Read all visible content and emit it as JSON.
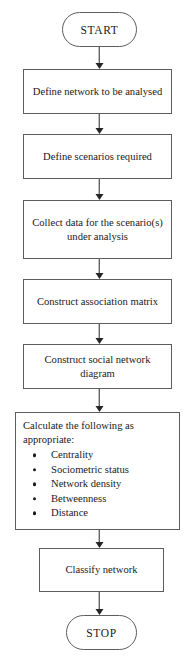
{
  "diagram": {
    "style": {
      "border_color": "#5d5d5d",
      "arrow_color": "#252525",
      "background": "#ffffff",
      "text_color": "#1a1a1a"
    },
    "nodes": [
      {
        "id": "start",
        "type": "terminal",
        "label": "START"
      },
      {
        "id": "define_network",
        "type": "process",
        "label": "Define network to be analysed"
      },
      {
        "id": "define_scenarios",
        "type": "process",
        "label": "Define scenarios required"
      },
      {
        "id": "collect_data",
        "type": "process",
        "label": "Collect data for the scenario(s) under analysis"
      },
      {
        "id": "assoc_matrix",
        "type": "process",
        "label": "Construct association matrix"
      },
      {
        "id": "sn_diagram",
        "type": "process",
        "label": "Construct social network diagram"
      },
      {
        "id": "calculate",
        "type": "list",
        "label": "Calculate the following as appropriate:",
        "items": [
          "Centrality",
          "Sociometric status",
          "Network density",
          "Betweenness",
          "Distance"
        ]
      },
      {
        "id": "classify",
        "type": "process",
        "label": "Classify network"
      },
      {
        "id": "stop",
        "type": "terminal",
        "label": "STOP"
      }
    ]
  }
}
